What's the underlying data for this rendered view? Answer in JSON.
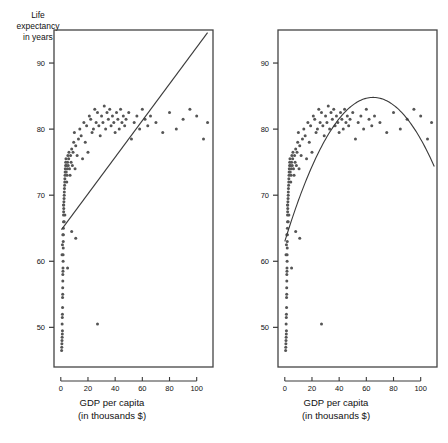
{
  "figure": {
    "width": 448,
    "height": 443,
    "background": "#ffffff",
    "ink_color": "#3a3a3a",
    "point_color": "#555555",
    "frame_color": "#444444"
  },
  "axis_titles": {
    "y_line1": "Life",
    "y_line2": "expectancy",
    "y_line3": "in years",
    "x_line1": "GDP per capita",
    "x_line2": "(in thousands $)"
  },
  "chart_data": [
    {
      "type": "scatter",
      "panel": "left",
      "title": "",
      "xlabel": "GDP per capita (in thousands $)",
      "ylabel": "Life expectancy in years",
      "xlim": [
        -5,
        112
      ],
      "ylim": [
        44,
        95
      ],
      "xticks": [
        0,
        20,
        40,
        60,
        80,
        100
      ],
      "xticklabels": [
        "0",
        "20",
        "40",
        "60",
        "80",
        "100"
      ],
      "yticks": [
        50,
        60,
        70,
        80,
        90
      ],
      "yticklabels": [
        "50",
        "60",
        "70",
        "80",
        "90"
      ],
      "grid": false,
      "legend": "none",
      "fit": {
        "kind": "linear",
        "label": "least-squares line",
        "x_start": 0.5,
        "y_start": 64.8,
        "x_end": 108.0,
        "y_end": 94.6
      },
      "x": [
        0.6,
        0.7,
        0.8,
        0.9,
        1.0,
        1.0,
        1.1,
        1.1,
        1.2,
        1.2,
        1.3,
        1.3,
        1.4,
        1.4,
        1.5,
        1.5,
        1.6,
        1.6,
        1.7,
        1.7,
        1.8,
        1.8,
        1.9,
        1.9,
        2.0,
        2.0,
        2.1,
        2.2,
        2.2,
        2.3,
        2.4,
        2.5,
        2.6,
        2.7,
        2.8,
        2.9,
        3.0,
        3.1,
        3.2,
        3.3,
        3.5,
        3.6,
        3.8,
        4.0,
        4.2,
        4.4,
        4.6,
        4.8,
        5.0,
        5.2,
        5.5,
        5.8,
        6.0,
        6.4,
        6.8,
        7.2,
        7.6,
        8.0,
        8.5,
        9.0,
        9.5,
        10.0,
        10.5,
        11.0,
        12.0,
        13.0,
        14.0,
        15.0,
        16.0,
        17.0,
        18.0,
        19.0,
        20.0,
        21.0,
        22.0,
        23.0,
        24.0,
        25.0,
        26.0,
        27.0,
        28.0,
        29.0,
        30.0,
        31.0,
        32.0,
        33.0,
        34.0,
        35.0,
        36.0,
        37.0,
        38.0,
        39.0,
        40.0,
        41.0,
        42.0,
        43.0,
        44.0,
        45.0,
        46.0,
        47.0,
        48.0,
        50.0,
        52.0,
        54.0,
        56.0,
        58.0,
        60.0,
        62.0,
        64.0,
        66.0,
        70.0,
        75.0,
        80.0,
        85.0,
        90.0,
        95.0,
        100.0,
        105.0,
        108.0,
        2.0,
        2.5,
        3.0,
        1.5,
        1.2,
        0.9,
        27.0,
        11.0,
        8.0,
        5.0
      ],
      "y": [
        46.5,
        47.0,
        47.5,
        48.0,
        48.5,
        50.5,
        49.0,
        51.5,
        52.0,
        49.5,
        53.0,
        54.5,
        55.0,
        56.0,
        57.0,
        58.0,
        58.5,
        59.0,
        60.0,
        61.0,
        62.0,
        63.0,
        64.0,
        65.0,
        66.0,
        67.0,
        67.5,
        68.0,
        68.5,
        69.0,
        69.5,
        70.0,
        70.5,
        71.0,
        71.5,
        72.0,
        72.5,
        73.0,
        73.5,
        74.0,
        74.5,
        75.0,
        75.5,
        73.5,
        74.5,
        72.0,
        73.0,
        74.0,
        75.0,
        76.0,
        74.5,
        75.5,
        76.5,
        74.0,
        73.0,
        76.0,
        75.0,
        77.0,
        74.5,
        76.5,
        78.0,
        79.5,
        74.0,
        77.5,
        76.0,
        78.5,
        80.0,
        79.0,
        75.5,
        81.0,
        78.0,
        80.5,
        76.5,
        82.0,
        81.5,
        79.5,
        80.0,
        83.0,
        81.0,
        82.5,
        80.5,
        79.0,
        82.0,
        81.0,
        83.5,
        80.0,
        82.5,
        81.5,
        83.0,
        80.5,
        82.0,
        81.0,
        79.5,
        82.5,
        81.5,
        80.0,
        83.0,
        81.0,
        82.0,
        80.5,
        81.5,
        82.5,
        78.5,
        81.0,
        82.0,
        80.0,
        83.0,
        81.5,
        80.5,
        82.0,
        81.0,
        79.5,
        82.5,
        80.0,
        81.5,
        83.0,
        82.0,
        78.5,
        81.0,
        68.5,
        66.0,
        67.0,
        64.0,
        62.5,
        61.0,
        50.5,
        63.5,
        64.5,
        59.0
      ]
    },
    {
      "type": "scatter",
      "panel": "right",
      "title": "",
      "xlabel": "GDP per capita (in thousands $)",
      "ylabel": "Life expectancy in years",
      "xlim": [
        -5,
        112
      ],
      "ylim": [
        44,
        95
      ],
      "xticks": [
        0,
        20,
        40,
        60,
        80,
        100
      ],
      "xticklabels": [
        "0",
        "20",
        "40",
        "60",
        "80",
        "100"
      ],
      "yticks": [
        50,
        60,
        70,
        80,
        90
      ],
      "yticklabels": [
        "50",
        "60",
        "70",
        "80",
        "90"
      ],
      "grid": false,
      "legend": "none",
      "fit": {
        "kind": "quadratic",
        "label": "quadratic fit curve",
        "vertex_x": 65,
        "vertex_y": 84.8,
        "y_at_x0": 63.0,
        "y_at_x110": 74.0
      },
      "x": [
        0.6,
        0.7,
        0.8,
        0.9,
        1.0,
        1.0,
        1.1,
        1.1,
        1.2,
        1.2,
        1.3,
        1.3,
        1.4,
        1.4,
        1.5,
        1.5,
        1.6,
        1.6,
        1.7,
        1.7,
        1.8,
        1.8,
        1.9,
        1.9,
        2.0,
        2.0,
        2.1,
        2.2,
        2.2,
        2.3,
        2.4,
        2.5,
        2.6,
        2.7,
        2.8,
        2.9,
        3.0,
        3.1,
        3.2,
        3.3,
        3.5,
        3.6,
        3.8,
        4.0,
        4.2,
        4.4,
        4.6,
        4.8,
        5.0,
        5.2,
        5.5,
        5.8,
        6.0,
        6.4,
        6.8,
        7.2,
        7.6,
        8.0,
        8.5,
        9.0,
        9.5,
        10.0,
        10.5,
        11.0,
        12.0,
        13.0,
        14.0,
        15.0,
        16.0,
        17.0,
        18.0,
        19.0,
        20.0,
        21.0,
        22.0,
        23.0,
        24.0,
        25.0,
        26.0,
        27.0,
        28.0,
        29.0,
        30.0,
        31.0,
        32.0,
        33.0,
        34.0,
        35.0,
        36.0,
        37.0,
        38.0,
        39.0,
        40.0,
        41.0,
        42.0,
        43.0,
        44.0,
        45.0,
        46.0,
        47.0,
        48.0,
        50.0,
        52.0,
        54.0,
        56.0,
        58.0,
        60.0,
        62.0,
        64.0,
        66.0,
        70.0,
        75.0,
        80.0,
        85.0,
        90.0,
        95.0,
        100.0,
        105.0,
        108.0,
        2.0,
        2.5,
        3.0,
        1.5,
        1.2,
        0.9,
        27.0,
        11.0,
        8.0,
        5.0
      ],
      "y": [
        46.5,
        47.0,
        47.5,
        48.0,
        48.5,
        50.5,
        49.0,
        51.5,
        52.0,
        49.5,
        53.0,
        54.5,
        55.0,
        56.0,
        57.0,
        58.0,
        58.5,
        59.0,
        60.0,
        61.0,
        62.0,
        63.0,
        64.0,
        65.0,
        66.0,
        67.0,
        67.5,
        68.0,
        68.5,
        69.0,
        69.5,
        70.0,
        70.5,
        71.0,
        71.5,
        72.0,
        72.5,
        73.0,
        73.5,
        74.0,
        74.5,
        75.0,
        75.5,
        73.5,
        74.5,
        72.0,
        73.0,
        74.0,
        75.0,
        76.0,
        74.5,
        75.5,
        76.5,
        74.0,
        73.0,
        76.0,
        75.0,
        77.0,
        74.5,
        76.5,
        78.0,
        79.5,
        74.0,
        77.5,
        76.0,
        78.5,
        80.0,
        79.0,
        75.5,
        81.0,
        78.0,
        80.5,
        76.5,
        82.0,
        81.5,
        79.5,
        80.0,
        83.0,
        81.0,
        82.5,
        80.5,
        79.0,
        82.0,
        81.0,
        83.5,
        80.0,
        82.5,
        81.5,
        83.0,
        80.5,
        82.0,
        81.0,
        79.5,
        82.5,
        81.5,
        80.0,
        83.0,
        81.0,
        82.0,
        80.5,
        81.5,
        82.5,
        78.5,
        81.0,
        82.0,
        80.0,
        83.0,
        81.5,
        80.5,
        82.0,
        81.0,
        79.5,
        82.5,
        80.0,
        81.5,
        83.0,
        82.0,
        78.5,
        81.0,
        68.5,
        66.0,
        67.0,
        64.0,
        62.5,
        61.0,
        50.5,
        63.5,
        64.5,
        59.0
      ]
    }
  ]
}
